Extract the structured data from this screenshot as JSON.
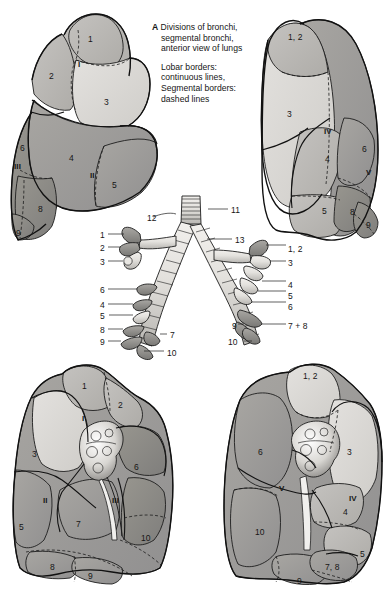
{
  "plate": {
    "letter": "A",
    "caption_lines": [
      "Divisions of bronchi,",
      "segmental bronchi,",
      "anterior view of lungs"
    ],
    "legend_lines": [
      "Lobar borders:",
      "continuous lines,",
      "Segmental borders:",
      "dashed lines"
    ]
  },
  "figures": {
    "upper_left_lung": {
      "title": "right lung, lateral view (upper left)",
      "segment_labels": [
        "1",
        "2",
        "3",
        "4",
        "5",
        "6",
        "8",
        "9"
      ],
      "lobe_labels": [
        "I",
        "II",
        "III"
      ]
    },
    "upper_right_lung": {
      "title": "left lung, lateral view (upper right)",
      "segment_labels": [
        "1, 2",
        "3",
        "4",
        "5",
        "6",
        "8",
        "9"
      ],
      "lobe_labels": [
        "IV",
        "V"
      ]
    },
    "bronchial_tree": {
      "title": "bronchial tree, anterior view (centre)",
      "trachea_labels": [
        "11",
        "12",
        "13"
      ],
      "left_side_labels": [
        "1",
        "2",
        "3",
        "6",
        "4",
        "5",
        "8",
        "9",
        "7",
        "10"
      ],
      "right_side_labels": [
        "1, 2",
        "3",
        "4",
        "5",
        "6",
        "7 + 8",
        "9",
        "10"
      ]
    },
    "lower_left_lung": {
      "title": "right lung, medial view (lower left)",
      "segment_labels": [
        "1",
        "2",
        "3",
        "5",
        "6",
        "7",
        "8",
        "9",
        "10"
      ],
      "lobe_labels": [
        "I",
        "II",
        "III"
      ]
    },
    "lower_right_lung": {
      "title": "left lung, medial view (lower right)",
      "segment_labels": [
        "1, 2",
        "3",
        "4",
        "5",
        "6",
        "7, 8",
        "9",
        "10"
      ],
      "lobe_labels": [
        "IV",
        "V"
      ]
    }
  },
  "labels": {
    "ul": [
      {
        "t": "1",
        "x": 88,
        "y": 35,
        "rom": false
      },
      {
        "t": "2",
        "x": 49,
        "y": 72,
        "rom": false
      },
      {
        "t": "I",
        "x": 78,
        "y": 61,
        "rom": true
      },
      {
        "t": "3",
        "x": 104,
        "y": 98,
        "rom": false
      },
      {
        "t": "4",
        "x": 69,
        "y": 154,
        "rom": false
      },
      {
        "t": "5",
        "x": 112,
        "y": 181,
        "rom": false
      },
      {
        "t": "II",
        "x": 90,
        "y": 172,
        "rom": true
      },
      {
        "t": "6",
        "x": 20,
        "y": 144,
        "rom": false
      },
      {
        "t": "III",
        "x": 14,
        "y": 163,
        "rom": true
      },
      {
        "t": "8",
        "x": 38,
        "y": 205,
        "rom": false
      },
      {
        "t": "9",
        "x": 16,
        "y": 229,
        "rom": false
      }
    ],
    "ur": [
      {
        "t": "1, 2",
        "x": 288,
        "y": 33,
        "rom": false
      },
      {
        "t": "3",
        "x": 287,
        "y": 110,
        "rom": false
      },
      {
        "t": "IV",
        "x": 324,
        "y": 128,
        "rom": true
      },
      {
        "t": "4",
        "x": 325,
        "y": 155,
        "rom": false
      },
      {
        "t": "6",
        "x": 362,
        "y": 145,
        "rom": false
      },
      {
        "t": "V",
        "x": 366,
        "y": 169,
        "rom": true
      },
      {
        "t": "5",
        "x": 322,
        "y": 207,
        "rom": false
      },
      {
        "t": "8",
        "x": 350,
        "y": 208,
        "rom": false
      },
      {
        "t": "9",
        "x": 366,
        "y": 221,
        "rom": false
      }
    ],
    "tree": [
      {
        "t": "11",
        "x": 231,
        "y": 206,
        "rom": false
      },
      {
        "t": "12",
        "x": 147,
        "y": 214,
        "rom": false
      },
      {
        "t": "13",
        "x": 235,
        "y": 236,
        "rom": false
      },
      {
        "t": "1",
        "x": 100,
        "y": 231,
        "rom": false
      },
      {
        "t": "2",
        "x": 100,
        "y": 244,
        "rom": false
      },
      {
        "t": "3",
        "x": 100,
        "y": 258,
        "rom": false
      },
      {
        "t": "6",
        "x": 100,
        "y": 286,
        "rom": false
      },
      {
        "t": "4",
        "x": 100,
        "y": 301,
        "rom": false
      },
      {
        "t": "5",
        "x": 100,
        "y": 312,
        "rom": false
      },
      {
        "t": "8",
        "x": 100,
        "y": 326,
        "rom": false
      },
      {
        "t": "9",
        "x": 100,
        "y": 338,
        "rom": false
      },
      {
        "t": "7",
        "x": 170,
        "y": 331,
        "rom": false
      },
      {
        "t": "10",
        "x": 167,
        "y": 349,
        "rom": false
      },
      {
        "t": "1, 2",
        "x": 288,
        "y": 245,
        "rom": false
      },
      {
        "t": "3",
        "x": 288,
        "y": 259,
        "rom": false
      },
      {
        "t": "4",
        "x": 288,
        "y": 281,
        "rom": false
      },
      {
        "t": "5",
        "x": 288,
        "y": 292,
        "rom": false
      },
      {
        "t": "6",
        "x": 288,
        "y": 303,
        "rom": false
      },
      {
        "t": "7 + 8",
        "x": 288,
        "y": 322,
        "rom": false
      },
      {
        "t": "9",
        "x": 232,
        "y": 322,
        "rom": false
      },
      {
        "t": "10",
        "x": 228,
        "y": 338,
        "rom": false
      }
    ],
    "ll": [
      {
        "t": "1",
        "x": 82,
        "y": 382,
        "rom": false
      },
      {
        "t": "2",
        "x": 118,
        "y": 401,
        "rom": false
      },
      {
        "t": "I",
        "x": 82,
        "y": 415,
        "rom": true
      },
      {
        "t": "3",
        "x": 32,
        "y": 450,
        "rom": false
      },
      {
        "t": "6",
        "x": 134,
        "y": 463,
        "rom": false
      },
      {
        "t": "II",
        "x": 43,
        "y": 497,
        "rom": true
      },
      {
        "t": "III",
        "x": 112,
        "y": 497,
        "rom": true
      },
      {
        "t": "5",
        "x": 19,
        "y": 523,
        "rom": false
      },
      {
        "t": "7",
        "x": 76,
        "y": 520,
        "rom": false
      },
      {
        "t": "10",
        "x": 141,
        "y": 534,
        "rom": false
      },
      {
        "t": "8",
        "x": 50,
        "y": 563,
        "rom": false
      },
      {
        "t": "9",
        "x": 88,
        "y": 572,
        "rom": false
      }
    ],
    "lr": [
      {
        "t": "1, 2",
        "x": 303,
        "y": 372,
        "rom": false
      },
      {
        "t": "6",
        "x": 258,
        "y": 448,
        "rom": false
      },
      {
        "t": "3",
        "x": 347,
        "y": 448,
        "rom": false
      },
      {
        "t": "V",
        "x": 279,
        "y": 485,
        "rom": true
      },
      {
        "t": "IV",
        "x": 349,
        "y": 495,
        "rom": true
      },
      {
        "t": "4",
        "x": 343,
        "y": 508,
        "rom": false
      },
      {
        "t": "10",
        "x": 255,
        "y": 528,
        "rom": false
      },
      {
        "t": "5",
        "x": 360,
        "y": 550,
        "rom": false
      },
      {
        "t": "7, 8",
        "x": 325,
        "y": 563,
        "rom": false
      },
      {
        "t": "9",
        "x": 297,
        "y": 577,
        "rom": false
      }
    ]
  },
  "colors": {
    "background": "#ffffff",
    "ink": "#1a1a1a",
    "tone_light": "#d9d9d9",
    "tone_mid": "#b9b9b9",
    "tone_dark": "#9e9e9e",
    "tone_darker": "#8a8a8a",
    "bronchus_light": "#e6e4e1",
    "bronchus_dark": "#8b8b8b"
  }
}
